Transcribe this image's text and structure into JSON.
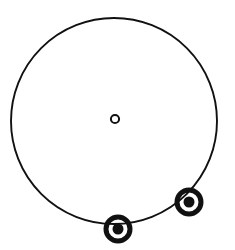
{
  "figure": {
    "canvas": {
      "width": 235,
      "height": 250,
      "background": "#ffffff"
    },
    "stroke_color": "#111111",
    "fill_color": "#111111",
    "main_circle": {
      "name": "main-circle",
      "center_x": 114,
      "center_y": 121,
      "radius": 103,
      "stroke_width": 1.9,
      "fill": "none"
    },
    "centre_marker": {
      "name": "centre-point",
      "center_x": 115,
      "center_y": 119,
      "outer_radius": 5.1,
      "ring_width": 2.0,
      "fill": "none"
    },
    "circumference_markers": [
      {
        "name": "bullseye-marker-bottom",
        "label": "bottom point",
        "center_x": 118,
        "center_y": 229,
        "outer_radius": 14.5,
        "ring_gap_radius": 9.5,
        "inner_dot_radius": 5.5,
        "outer_ring_width": 5.0
      },
      {
        "name": "bullseye-marker-lower-right",
        "label": "lower-right point",
        "center_x": 189,
        "center_y": 202,
        "outer_radius": 14.5,
        "ring_gap_radius": 9.5,
        "inner_dot_radius": 5.5,
        "outer_ring_width": 5.0
      }
    ]
  }
}
